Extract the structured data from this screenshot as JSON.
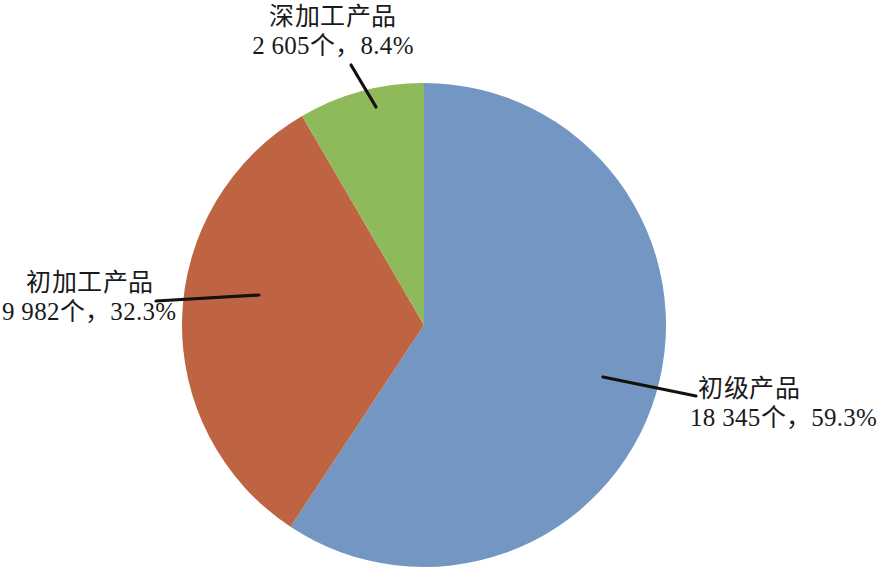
{
  "chart_data": {
    "type": "pie",
    "title": "",
    "subtitle": "",
    "xlabel": "",
    "ylabel": "",
    "legend_position": "none",
    "grid": false,
    "unit_suffix": "个",
    "separator": "，",
    "start_angle_deg": 0,
    "direction": "clockwise",
    "total_count": 30932,
    "categories": [
      "初级产品",
      "初加工产品",
      "深加工产品"
    ],
    "values": [
      18345,
      9982,
      2605
    ],
    "percents": [
      59.3,
      32.3,
      8.4
    ],
    "colors": [
      "#7396c3",
      "#bf6442",
      "#8fba5c"
    ],
    "slices": [
      {
        "name": "初级产品",
        "count": 18345,
        "count_text": "18 345",
        "percent": 59.3,
        "percent_text": "59.3%",
        "color": "#7396c3",
        "label_line1": "初级产品",
        "label_line2": "18 345个，59.3%"
      },
      {
        "name": "初加工产品",
        "count": 9982,
        "count_text": "9 982",
        "percent": 32.3,
        "percent_text": "32.3%",
        "color": "#bf6442",
        "label_line1": "初加工产品",
        "label_line2": "9 982个，32.3%"
      },
      {
        "name": "深加工产品",
        "count": 2605,
        "count_text": "2 605",
        "percent": 8.4,
        "percent_text": "8.4%",
        "color": "#8fba5c",
        "label_line1": "深加工产品",
        "label_line2": "2 605个，8.4%"
      }
    ]
  },
  "labels": {
    "deep_processed": {
      "name": "深加工产品",
      "value": "2 605个，8.4%"
    },
    "primary_processed": {
      "name": "初加工产品",
      "value": "9 982个，32.3%"
    },
    "raw": {
      "name": "初级产品",
      "value": "18 345个，59.3%"
    }
  },
  "style": {
    "background": "#ffffff",
    "leader_line_color": "#14100c",
    "text_color": "#1a1a1a"
  }
}
